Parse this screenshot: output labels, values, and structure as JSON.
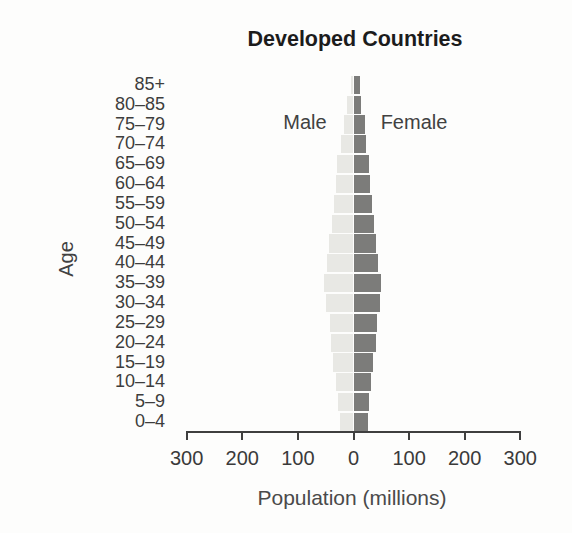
{
  "figure": {
    "title": "Developed Countries",
    "y_axis_label": "Age",
    "x_axis_label": "Population (millions)",
    "male_label": "Male",
    "female_label": "Female"
  },
  "chart_data": {
    "type": "bar",
    "subtype": "population-pyramid",
    "title": "Developed Countries",
    "xlabel": "Population (millions)",
    "ylabel": "Age",
    "categories_order": "top-to-bottom",
    "categories": [
      "85+",
      "80–85",
      "75–79",
      "70–74",
      "65–69",
      "60–64",
      "55–59",
      "50–54",
      "45–49",
      "40–44",
      "35–39",
      "30–34",
      "25–29",
      "20–24",
      "15–19",
      "10–14",
      "5–9",
      "0–4"
    ],
    "series": [
      {
        "name": "Male",
        "side": "left",
        "color": "#e8e8e4",
        "values": [
          3,
          10,
          17,
          22,
          28,
          31,
          34,
          38,
          43,
          47,
          53,
          48,
          41,
          40,
          36,
          31,
          27,
          23
        ]
      },
      {
        "name": "Female",
        "side": "right",
        "color": "#7c7c7a",
        "values": [
          10,
          13,
          19,
          22,
          26,
          29,
          32,
          35,
          40,
          43,
          49,
          46,
          42,
          39,
          34,
          30,
          26,
          25
        ]
      }
    ],
    "x_tick_labels": [
      "300",
      "200",
      "100",
      "0",
      "100",
      "200",
      "300"
    ],
    "xlim_each_side": 300,
    "grid": false,
    "legend_position": "inline-above-bars"
  },
  "colors": {
    "male_bar": "#e8e8e4",
    "female_bar": "#7c7c7a",
    "axis": "#3f3f3f",
    "tick_text": "#3a3a3a",
    "label_text": "#414141",
    "title_text": "#1c1c1c",
    "background": "#fdfdfc"
  }
}
